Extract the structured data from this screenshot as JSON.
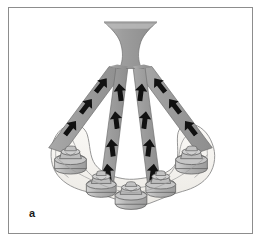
{
  "figure": {
    "panel_label": "a",
    "caption_absent": true,
    "frame": {
      "border_color": "#8d8d8d",
      "background": "#ffffff"
    },
    "colors": {
      "bar_fill": "#9b9b9b",
      "bar_fill_light": "#a8a8a8",
      "bar_outline": "#6f6f6f",
      "ridge_fill": "#f4f2ee",
      "ridge_outline": "#8a8a8a",
      "abutment_fill": "#b9b9b9",
      "abutment_outline": "#636363",
      "arrow_color": "#111111",
      "label_color": "#1a1a1a"
    },
    "structures": {
      "prosthesis_stem": {
        "name": "flared-prosthesis-stem",
        "description": "trumpet shaped superstructure at top center"
      },
      "ridge": {
        "name": "mandibular-alveolar-ridge",
        "description": "pale horseshoe shaped arch at bottom"
      },
      "bars": [
        {
          "id": "bar-left-outer",
          "arrows": 3,
          "direction": "up-right"
        },
        {
          "id": "bar-left-inner",
          "arrows": 4,
          "direction": "up"
        },
        {
          "id": "bar-right-inner",
          "arrows": 4,
          "direction": "up"
        },
        {
          "id": "bar-right-outer",
          "arrows": 3,
          "direction": "up-left"
        }
      ],
      "implants": [
        {
          "id": "implant-left-posterior",
          "position": "left posterior"
        },
        {
          "id": "implant-left-middle",
          "position": "left middle"
        },
        {
          "id": "implant-center",
          "position": "midline"
        },
        {
          "id": "implant-right-middle",
          "position": "right middle"
        },
        {
          "id": "implant-right-posterior",
          "position": "right posterior"
        }
      ]
    },
    "arrow_legend": {
      "meaning": "direction of force transmission",
      "glyph": "up-arrow"
    }
  }
}
